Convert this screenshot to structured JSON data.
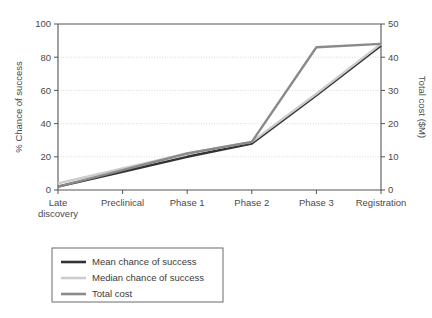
{
  "chart_data": {
    "type": "line",
    "title": "",
    "xlabel": "",
    "categories": [
      "Late discovery",
      "Preclinical",
      "Phase 1",
      "Phase 2",
      "Phase 3",
      "Registration"
    ],
    "category_lines": [
      [
        "Late",
        "discovery"
      ],
      [
        "Preclinical"
      ],
      [
        "Phase 1"
      ],
      [
        "Phase 2"
      ],
      [
        "Phase 3"
      ],
      [
        "Registration"
      ]
    ],
    "left_axis": {
      "label": "% Chance of success",
      "ticks": [
        0,
        20,
        40,
        60,
        80,
        100
      ],
      "ylim": [
        0,
        100
      ]
    },
    "right_axis": {
      "label": "Total cost ($M)",
      "ticks": [
        0,
        10,
        20,
        30,
        40,
        50
      ],
      "ylim": [
        0,
        50
      ]
    },
    "grid": true,
    "legend_position": "below-left",
    "series": [
      {
        "name": "Mean chance of success",
        "axis": "left",
        "color": "#333333",
        "width": 2.4,
        "values": [
          2,
          11,
          20,
          28,
          57,
          87
        ]
      },
      {
        "name": "Median chance of success",
        "axis": "left",
        "color": "#cccccc",
        "width": 2.4,
        "values": [
          4,
          13,
          22,
          29,
          58,
          88
        ]
      },
      {
        "name": "Total cost",
        "axis": "right",
        "color": "#8a8a8a",
        "width": 2.4,
        "values": [
          1.0,
          6.0,
          11.0,
          14.5,
          43.0,
          44.0
        ]
      }
    ]
  },
  "legend": {
    "entries": [
      {
        "label": "Mean chance of success",
        "color": "#333333"
      },
      {
        "label": "Median chance of success",
        "color": "#cccccc"
      },
      {
        "label": "Total cost",
        "color": "#8a8a8a"
      }
    ]
  }
}
